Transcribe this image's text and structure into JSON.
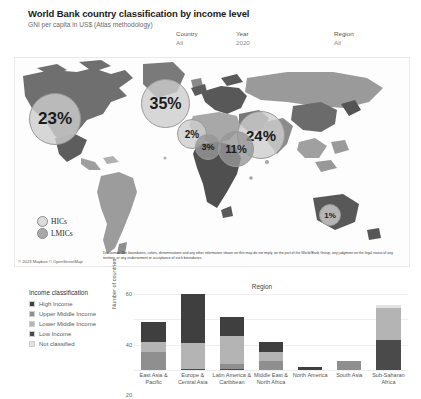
{
  "header": {
    "title": "World Bank country classification by income level",
    "subtitle": "GNI per capita in US$ (Atlas methodology)"
  },
  "filters": [
    {
      "name": "country",
      "label": "Country",
      "value": "All"
    },
    {
      "name": "year",
      "label": "Year",
      "value": "2020"
    },
    {
      "name": "region",
      "label": "Region",
      "value": "All"
    }
  ],
  "map": {
    "bubbles": [
      {
        "label": "23%",
        "class": "hic",
        "left": 14,
        "top": 35,
        "size": 52
      },
      {
        "label": "35%",
        "class": "hic",
        "left": 126,
        "top": 21,
        "size": 49
      },
      {
        "label": "2%",
        "class": "hic",
        "left": 162,
        "top": 61,
        "size": 30
      },
      {
        "label": "3%",
        "class": "lmic",
        "left": 180,
        "top": 76,
        "size": 26
      },
      {
        "label": "24%",
        "class": "hic",
        "left": 222,
        "top": 53,
        "size": 48
      },
      {
        "label": "11%",
        "class": "lmic",
        "left": 203,
        "top": 73,
        "size": 36
      },
      {
        "label": "1%",
        "class": "hic",
        "left": 304,
        "top": 146,
        "size": 22
      }
    ],
    "legend": [
      {
        "key": "hic",
        "label": "HICs"
      },
      {
        "key": "lmic",
        "label": "LMICs"
      }
    ],
    "attribution": "© 2023 Mapbox © OpenStreetMap",
    "disclaimer": "Disclaimer: The boundaries, colors, denominations and any other information shown on this map do not imply, on the part of the World Bank Group, any judgment on the legal status of any territory, or any endorsement or acceptance of such boundaries."
  },
  "income_legend": {
    "title": "Income classification",
    "items": [
      {
        "label": "High Income",
        "color": "#3f3f3f"
      },
      {
        "label": "Upper Middle Income",
        "color": "#8f8f8f"
      },
      {
        "label": "Lower Middle Income",
        "color": "#b4b4b4"
      },
      {
        "label": "Low Income",
        "color": "#4a4a4a"
      },
      {
        "label": "Not classified",
        "color": "#e2e2e2"
      }
    ]
  },
  "chart_data": {
    "type": "bar",
    "title": "Region",
    "xlabel": "",
    "ylabel": "Number of countries",
    "ylim": [
      0,
      60
    ],
    "yticks": [
      0,
      20,
      40,
      60
    ],
    "grid": true,
    "stacked": true,
    "legend_position": "left-outside",
    "categories": [
      "East Asia & Pacific",
      "Europe & Central Asia",
      "Latin America & Caribbean",
      "Middle East & North Africa",
      "North America",
      "South Asia",
      "Sub-Saharan Africa"
    ],
    "series": [
      {
        "name": "Low Income",
        "color": "#4a4a4a",
        "values": [
          0,
          1,
          1,
          0,
          0,
          0,
          24
        ]
      },
      {
        "name": "Lower Middle Income",
        "color": "#8f8f8f",
        "values": [
          14,
          0,
          4,
          7,
          0,
          7,
          0
        ]
      },
      {
        "name": "Upper Middle Income",
        "color": "#b4b4b4",
        "values": [
          8,
          20,
          22,
          7,
          0,
          0,
          25
        ]
      },
      {
        "name": "High Income",
        "color": "#3f3f3f",
        "values": [
          16,
          39,
          15,
          8,
          2,
          0,
          0
        ]
      },
      {
        "name": "Not classified",
        "color": "#e2e2e2",
        "values": [
          0,
          0,
          0,
          0,
          0,
          0,
          2
        ]
      }
    ],
    "totals": [
      38,
      60,
      42,
      22,
      2,
      7,
      51
    ]
  }
}
